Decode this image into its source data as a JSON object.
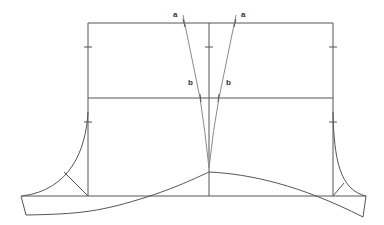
{
  "diagram": {
    "type": "pattern-drafting-diagram",
    "labels": {
      "a_left": "a",
      "a_right": "a",
      "b_left": "b",
      "b_right": "b"
    },
    "colors": {
      "line": "#555555",
      "light_line": "#8a8a8a",
      "text": "#333333",
      "background": "#ffffff"
    }
  }
}
